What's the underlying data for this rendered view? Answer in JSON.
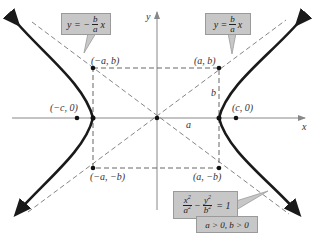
{
  "diagram": {
    "axes": {
      "x_label": "x",
      "y_label": "y"
    },
    "points": [
      {
        "id": "vertex-left-top",
        "label": "(−a, b)"
      },
      {
        "id": "vertex-right-top",
        "label": "(a, b)"
      },
      {
        "id": "vertex-left-bottom",
        "label": "(−a, −b)"
      },
      {
        "id": "vertex-right-bottom",
        "label": "(a, −b)"
      },
      {
        "id": "focus-left",
        "label": "(−c, 0)"
      },
      {
        "id": "focus-right",
        "label": "(c, 0)"
      }
    ],
    "segment_labels": {
      "a": "a",
      "b": "b"
    },
    "asymptote_left": {
      "prefix": "y = −",
      "num": "b",
      "den": "a",
      "suffix": "x"
    },
    "asymptote_right": {
      "prefix": "y = ",
      "num": "b",
      "den": "a",
      "suffix": "x"
    },
    "equation": {
      "term1_num": "x",
      "term1_den": "a",
      "minus": "−",
      "term2_num": "y",
      "term2_den": "b",
      "rhs": "= 1",
      "exp": "2"
    },
    "condition": "a > 0, b > 0",
    "colors": {
      "curve": "#1a1a1a",
      "axis": "#888888",
      "dashed": "#555555",
      "callout_fill": "#c7c7c7",
      "callout_border": "#9a9a9a"
    }
  }
}
